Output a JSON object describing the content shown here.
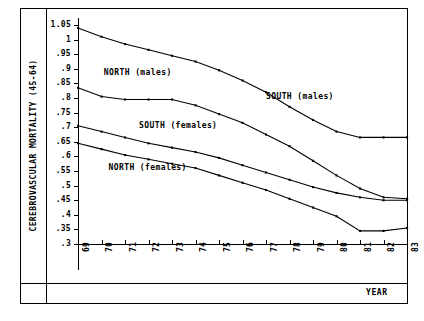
{
  "figure": {
    "ylabel": "CEREBROVASCULAR MORTALITY (45-64)",
    "xlabel": "YEAR"
  },
  "chart_data": {
    "type": "line",
    "title": "",
    "xlabel": "YEAR",
    "ylabel": "CEREBROVASCULAR MORTALITY (45-64)",
    "grid": false,
    "legend_position": "inline-annotations",
    "x": [
      69,
      70,
      71,
      72,
      73,
      74,
      75,
      76,
      77,
      78,
      79,
      80,
      81,
      82,
      83
    ],
    "xtick_labels": [
      "69",
      "70",
      "71",
      "72",
      "73",
      "74",
      "75",
      "76",
      "77",
      "78",
      "79",
      "80",
      "81",
      "82",
      "83"
    ],
    "xlim": [
      69,
      83
    ],
    "ylim": [
      0.3,
      1.05
    ],
    "ytick_labels": [
      "1.05",
      "1",
      ".95",
      ".9",
      ".85",
      ".8",
      ".75",
      ".7",
      ".65",
      ".6",
      ".55",
      ".5",
      ".45",
      ".4",
      ".35",
      ".3"
    ],
    "ytick_values": [
      1.05,
      1.0,
      0.95,
      0.9,
      0.85,
      0.8,
      0.75,
      0.7,
      0.65,
      0.6,
      0.55,
      0.5,
      0.45,
      0.4,
      0.35,
      0.3
    ],
    "series": [
      {
        "name": "SOUTH (males)",
        "values": [
          1.04,
          1.01,
          0.985,
          0.965,
          0.945,
          0.925,
          0.895,
          0.86,
          0.82,
          0.77,
          0.725,
          0.685,
          0.665,
          0.665,
          0.665
        ]
      },
      {
        "name": "NORTH (males)",
        "values": [
          0.835,
          0.805,
          0.795,
          0.795,
          0.795,
          0.775,
          0.745,
          0.715,
          0.675,
          0.635,
          0.585,
          0.535,
          0.49,
          0.46,
          0.455
        ]
      },
      {
        "name": "SOUTH (females)",
        "values": [
          0.705,
          0.685,
          0.665,
          0.645,
          0.63,
          0.615,
          0.595,
          0.57,
          0.545,
          0.52,
          0.495,
          0.475,
          0.46,
          0.45,
          0.45
        ]
      },
      {
        "name": "NORTH (females)",
        "values": [
          0.645,
          0.625,
          0.605,
          0.59,
          0.575,
          0.56,
          0.535,
          0.51,
          0.485,
          0.455,
          0.425,
          0.395,
          0.345,
          0.345,
          0.355
        ]
      }
    ],
    "annotations": [
      {
        "text": "NORTH (males)",
        "x": 70.1,
        "y": 0.885
      },
      {
        "text": "SOUTH (females)",
        "x": 71.6,
        "y": 0.705
      },
      {
        "text": "NORTH (females)",
        "x": 70.3,
        "y": 0.56
      },
      {
        "text": "SOUTH (males)",
        "x": 77.0,
        "y": 0.805
      }
    ]
  }
}
